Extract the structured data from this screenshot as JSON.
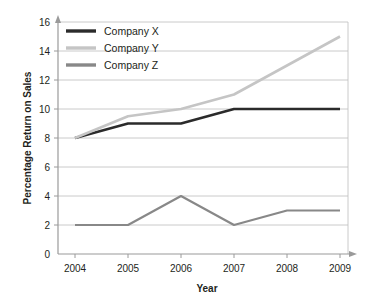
{
  "chart_data": {
    "type": "line",
    "title": "",
    "xlabel": "Year",
    "ylabel": "Percentage Return on Sales",
    "categories": [
      "2004",
      "2005",
      "2006",
      "2007",
      "2008",
      "2009"
    ],
    "x": [
      2004,
      2005,
      2006,
      2007,
      2008,
      2009
    ],
    "xlim": [
      2004,
      2009
    ],
    "ylim": [
      0,
      16
    ],
    "yticks": [
      0,
      2,
      4,
      6,
      8,
      10,
      12,
      14,
      16
    ],
    "ytick_labels": [
      "0",
      "2",
      "4",
      "6",
      "8",
      "10",
      "12",
      "14",
      "16"
    ],
    "grid": "horizontal",
    "legend_position": "top-left",
    "series": [
      {
        "name": "Company X",
        "color": "#2b2b2b",
        "values": [
          8,
          9,
          9,
          10,
          10,
          10
        ]
      },
      {
        "name": "Company Y",
        "color": "#c5c5c5",
        "values": [
          8,
          9.5,
          10,
          11,
          13,
          15
        ]
      },
      {
        "name": "Company Z",
        "color": "#888888",
        "values": [
          2,
          2,
          4,
          2,
          3,
          3
        ]
      }
    ]
  },
  "axes": {
    "y_title": "Percentage Return on Sales",
    "x_title": "Year",
    "y_ticks": [
      "16",
      "14",
      "12",
      "10",
      "8",
      "6",
      "4",
      "2",
      "0"
    ],
    "x_ticks": [
      "2004",
      "2005",
      "2006",
      "2007",
      "2008",
      "2009"
    ]
  },
  "legend": {
    "items": [
      {
        "label": "Company X",
        "color": "#2b2b2b"
      },
      {
        "label": "Company Y",
        "color": "#c5c5c5"
      },
      {
        "label": "Company Z",
        "color": "#888888"
      }
    ]
  },
  "colors": {
    "background": "#ffffff",
    "grid": "#bdbdbd",
    "axis": "#9a9a9a",
    "text": "#231f20"
  }
}
